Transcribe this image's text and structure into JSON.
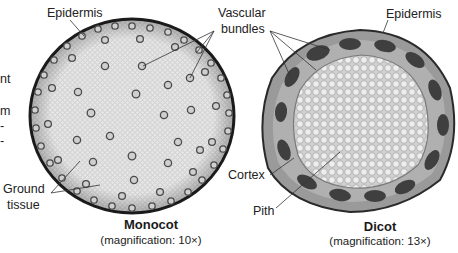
{
  "figure": {
    "left_edge_fragments": [
      "nt",
      "m",
      "-",
      "-"
    ],
    "monocot": {
      "title": "Monocot",
      "caption": "(magnification: 10×)",
      "labels": {
        "epidermis": "Epidermis",
        "vascular_line1": "Vascular",
        "vascular_line2": "bundles",
        "ground_line1": "Ground",
        "ground_line2": "tissue"
      }
    },
    "dicot": {
      "title": "Dicot",
      "caption": "(magnification: 13×)",
      "labels": {
        "epidermis": "Epidermis",
        "cortex": "Cortex",
        "pith": "Pith"
      }
    },
    "colors": {
      "epidermis_edge": "#2a2a2a",
      "ground_tissue": "#e4e4e4",
      "bundle": "#6a6a6a",
      "dicot_cortex": "#8f8f8f",
      "dicot_bundle": "#3f3f3f",
      "dicot_pith": "#dcdcdc"
    }
  }
}
